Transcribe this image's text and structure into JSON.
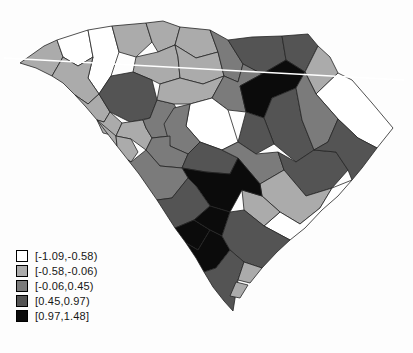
{
  "figure": {
    "background": "#fdfdfd",
    "border_color": "#242424",
    "artifact_line": {
      "x1": 4,
      "y1": 58,
      "x2": 404,
      "y2": 80,
      "color": "#ffffff",
      "width": 1.3
    }
  },
  "legend": {
    "items": [
      {
        "label": "[-1.09,-0.58)",
        "bin": 0
      },
      {
        "label": "[-0.58,-0.06)",
        "bin": 1
      },
      {
        "label": "[-0.06,0.45)",
        "bin": 2
      },
      {
        "label": "[0.45,0.97)",
        "bin": 3
      },
      {
        "label": "[0.97,1.48]",
        "bin": 4
      }
    ]
  },
  "chart_data": {
    "type": "heatmap",
    "subtype": "choropleth-map",
    "region": "South Carolina counties",
    "title": "",
    "legend_position": "bottom-left",
    "bins": [
      "[-1.09,-0.58)",
      "[-0.58,-0.06)",
      "[-0.06,0.45)",
      "[0.45,0.97)",
      "[0.97,1.48]"
    ],
    "palette": [
      "#ffffff",
      "#ababab",
      "#7b7b7b",
      "#545454",
      "#0b0b0b"
    ],
    "counties": [
      {
        "name": "oconee",
        "bin": 1,
        "points": "20,63 44,46 57,40 63,57 52,76 36,68"
      },
      {
        "name": "pickens",
        "bin": 0,
        "points": "57,40 88,30 93,57 78,66 63,57"
      },
      {
        "name": "greenville",
        "bin": 0,
        "points": "88,30 112,26 119,52 111,76 99,94 88,78 93,57"
      },
      {
        "name": "spartanburg",
        "bin": 1,
        "points": "112,26 146,23 152,42 136,57 119,52"
      },
      {
        "name": "cherokee",
        "bin": 1,
        "points": "146,23 163,21 180,27 175,45 158,52 152,42"
      },
      {
        "name": "york",
        "bin": 1,
        "points": "180,27 210,30 218,52 196,58 175,45"
      },
      {
        "name": "union",
        "bin": 1,
        "points": "133,72 136,57 158,52 175,45 178,57 180,78 160,84 152,80"
      },
      {
        "name": "chester",
        "bin": 1,
        "points": "175,45 196,58 218,52 224,76 203,84 180,78 178,57"
      },
      {
        "name": "lancaster",
        "bin": 2,
        "points": "210,30 228,40 243,64 238,82 224,76 218,52"
      },
      {
        "name": "chesterfield",
        "bin": 3,
        "points": "228,40 252,37 282,36 286,60 262,74 243,64"
      },
      {
        "name": "marlboro",
        "bin": 3,
        "points": "282,36 308,34 318,46 305,72 286,60"
      },
      {
        "name": "dillon",
        "bin": 1,
        "points": "318,46 330,57 338,73 316,94 305,72"
      },
      {
        "name": "horry",
        "bin": 0,
        "points": "338,73 352,80 372,103 393,128 377,148 358,138 338,119 316,94"
      },
      {
        "name": "anderson",
        "bin": 1,
        "points": "63,57 78,66 93,57 88,78 99,94 88,104 75,95 63,83 52,76"
      },
      {
        "name": "abbeville",
        "bin": 1,
        "points": "75,95 88,104 99,94 110,112 104,122 97,120 86,107"
      },
      {
        "name": "laurens",
        "bin": 3,
        "points": "99,94 111,76 133,72 152,80 157,100 150,118 130,122 110,112"
      },
      {
        "name": "greenwood",
        "bin": 1,
        "points": "97,120 104,122 110,112 122,123 116,136 103,133"
      },
      {
        "name": "mccormick",
        "bin": 1,
        "points": "97,120 116,136 117,146 107,133"
      },
      {
        "name": "saluda",
        "bin": 1,
        "points": "116,136 122,123 143,120 146,128 152,138 146,150 131,139"
      },
      {
        "name": "newberry",
        "bin": 2,
        "points": "143,120 150,118 157,100 174,104 183,122 170,136 152,138 146,128"
      },
      {
        "name": "edgefield",
        "bin": 1,
        "points": "117,146 116,136 131,139 138,152 131,162 128,160"
      },
      {
        "name": "fairfield",
        "bin": 1,
        "points": "160,84 180,78 203,84 224,76 212,98 190,104 174,104 157,100"
      },
      {
        "name": "kershaw",
        "bin": 2,
        "points": "224,76 238,82 243,64 262,74 240,86 246,112 228,110 212,98"
      },
      {
        "name": "darlington",
        "bin": 4,
        "points": "240,86 262,74 286,60 305,72 296,88 272,98 264,118 246,112"
      },
      {
        "name": "florence",
        "bin": 3,
        "points": "264,118 272,98 296,88 302,120 314,150 296,162 274,144"
      },
      {
        "name": "marion",
        "bin": 2,
        "points": "296,88 305,72 316,94 338,119 328,142 314,150 302,120"
      },
      {
        "name": "lee",
        "bin": 3,
        "points": "246,112 264,118 274,144 256,154 238,142"
      },
      {
        "name": "sumter",
        "bin": 0,
        "points": "190,104 212,98 228,110 238,142 222,150 200,142 186,126"
      },
      {
        "name": "richland",
        "bin": 2,
        "points": "190,104 186,126 200,142 188,154 170,146 164,124 174,108"
      },
      {
        "name": "lexington",
        "bin": 2,
        "points": "152,138 170,136 170,146 188,154 182,168 160,166 146,150"
      },
      {
        "name": "calhoun",
        "bin": 3,
        "points": "188,154 200,142 222,150 238,158 230,174 206,172 182,168"
      },
      {
        "name": "clarendon",
        "bin": 2,
        "points": "222,150 238,142 256,154 278,152 284,170 260,184 238,158"
      },
      {
        "name": "williamsburg",
        "bin": 3,
        "points": "278,152 296,162 314,150 336,152 348,170 332,188 306,196 284,170"
      },
      {
        "name": "georgetown",
        "bin": 3,
        "points": "314,150 328,142 338,119 358,138 377,148 362,168 352,180 348,170 336,152"
      },
      {
        "name": "berkeley",
        "bin": 1,
        "points": "260,184 284,170 306,196 332,188 320,208 300,224 280,212 262,196"
      },
      {
        "name": "charleston",
        "bin": 0,
        "points": "332,188 320,208 300,224 280,212 264,226 290,240 305,228 322,210 338,196 352,180"
      },
      {
        "name": "dorchester",
        "bin": 1,
        "points": "242,190 262,196 280,212 264,226 244,210"
      },
      {
        "name": "orangeburg",
        "bin": 4,
        "points": "188,178 182,168 206,172 230,174 238,158 260,184 262,196 242,190 230,212 210,206 196,186"
      },
      {
        "name": "aiken",
        "bin": 2,
        "points": "128,160 131,162 146,150 160,166 182,168 188,178 172,198 157,200 139,174"
      },
      {
        "name": "barnwell",
        "bin": 3,
        "points": "157,200 172,198 188,178 196,186 210,206 194,220 175,228 166,214"
      },
      {
        "name": "allendale",
        "bin": 4,
        "points": "175,228 194,220 210,230 198,250 186,243"
      },
      {
        "name": "bamberg",
        "bin": 4,
        "points": "194,220 210,206 230,212 222,236 210,230"
      },
      {
        "name": "hampton",
        "bin": 4,
        "points": "186,243 198,250 210,230 222,236 230,250 216,268 204,272 196,258"
      },
      {
        "name": "colleton",
        "bin": 3,
        "points": "222,236 230,212 244,210 264,226 290,240 277,252 262,268 244,262 230,250"
      },
      {
        "name": "jasper",
        "bin": 3,
        "points": "204,272 216,268 230,250 244,262 238,280 233,311 224,301 213,287"
      },
      {
        "name": "beaufort",
        "bin": 1,
        "points": "244,262 262,268 250,283 238,280"
      },
      {
        "name": "beaufort-south",
        "bin": 1,
        "points": "236,282 248,285 240,298 230,296"
      }
    ]
  }
}
